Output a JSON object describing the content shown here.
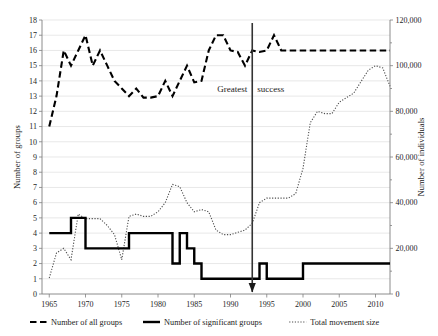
{
  "chart_data": {
    "type": "line",
    "title": "",
    "xlabel": "",
    "ylabel": "Number of groups",
    "y2label": "Number of individuals",
    "xlim": [
      1964,
      2012
    ],
    "ylim": [
      0,
      18
    ],
    "y2lim": [
      0,
      120000
    ],
    "grid": true,
    "legend_position": "bottom",
    "x_ticks": [
      "1965",
      "1970",
      "1975",
      "1980",
      "1985",
      "1990",
      "1995",
      "2000",
      "2005",
      "2010"
    ],
    "x_tick_values": [
      1965,
      1970,
      1975,
      1980,
      1985,
      1990,
      1995,
      2000,
      2005,
      2010
    ],
    "y_ticks": [
      "0",
      "1",
      "2",
      "3",
      "4",
      "5",
      "6",
      "7",
      "8",
      "9",
      "10",
      "11",
      "12",
      "13",
      "14",
      "15",
      "16",
      "17",
      "18"
    ],
    "y_tick_values": [
      0,
      1,
      2,
      3,
      4,
      5,
      6,
      7,
      8,
      9,
      10,
      11,
      12,
      13,
      14,
      15,
      16,
      17,
      18
    ],
    "y2_ticks": [
      "0",
      "20,000",
      "40,000",
      "60,000",
      "80,000",
      "100,000",
      "120,000"
    ],
    "y2_tick_values": [
      0,
      20000,
      40000,
      60000,
      80000,
      100000,
      120000
    ],
    "x": [
      1965,
      1966,
      1967,
      1968,
      1969,
      1970,
      1971,
      1972,
      1973,
      1974,
      1975,
      1976,
      1977,
      1978,
      1979,
      1980,
      1981,
      1982,
      1983,
      1984,
      1985,
      1986,
      1987,
      1988,
      1989,
      1990,
      1991,
      1992,
      1993,
      1994,
      1995,
      1996,
      1997,
      1998,
      1999,
      2000,
      2001,
      2002,
      2003,
      2004,
      2005,
      2006,
      2007,
      2008,
      2009,
      2010,
      2011,
      2012
    ],
    "series": [
      {
        "name": "Number of all groups",
        "axis": "left",
        "style": "dashed",
        "values": [
          11,
          13,
          16,
          15,
          16,
          17,
          15,
          16,
          15,
          14,
          13.5,
          13,
          13.5,
          12.9,
          12.9,
          13,
          14,
          13,
          14,
          15,
          13.9,
          14,
          16,
          17,
          17,
          16,
          15.9,
          15,
          16,
          15.9,
          16,
          17,
          16,
          16,
          16,
          16,
          16,
          16,
          16,
          16,
          16,
          16,
          16,
          16,
          16,
          16,
          16,
          16
        ]
      },
      {
        "name": "Number of significant groups",
        "axis": "left",
        "style": "solid",
        "values": [
          4,
          4,
          4,
          5,
          5,
          3,
          3,
          3,
          3,
          3,
          3,
          4,
          4,
          4,
          4,
          4,
          4,
          2,
          4,
          3,
          2,
          1,
          1,
          1,
          1,
          1,
          1,
          1,
          1,
          2,
          1,
          1,
          1,
          1,
          1,
          2,
          2,
          2,
          2,
          2,
          2,
          2,
          2,
          2,
          2,
          2,
          2,
          2
        ]
      },
      {
        "name": "Total movement size",
        "axis": "right",
        "style": "dotted",
        "values": [
          7000,
          18000,
          20000,
          15000,
          35000,
          33000,
          33000,
          33000,
          30000,
          26000,
          15000,
          34000,
          35000,
          34000,
          34000,
          36000,
          40000,
          48000,
          47000,
          40000,
          36000,
          37000,
          36000,
          28000,
          26000,
          26000,
          27000,
          28000,
          31000,
          40000,
          42000,
          42000,
          42000,
          42000,
          44000,
          55000,
          75000,
          80000,
          79000,
          79000,
          84000,
          86000,
          88000,
          93000,
          98000,
          100000,
          99000,
          91000
        ]
      }
    ],
    "annotations": [
      {
        "name": "greatest-success",
        "text_left": "Greatest",
        "text_right": "success",
        "vline_year": 1993,
        "marker": "down-arrow"
      }
    ],
    "legend": [
      {
        "label": "Number of all groups",
        "style": "dashed"
      },
      {
        "label": "Number of significant groups",
        "style": "solid"
      },
      {
        "label": "Total movement size",
        "style": "dotted"
      }
    ]
  }
}
